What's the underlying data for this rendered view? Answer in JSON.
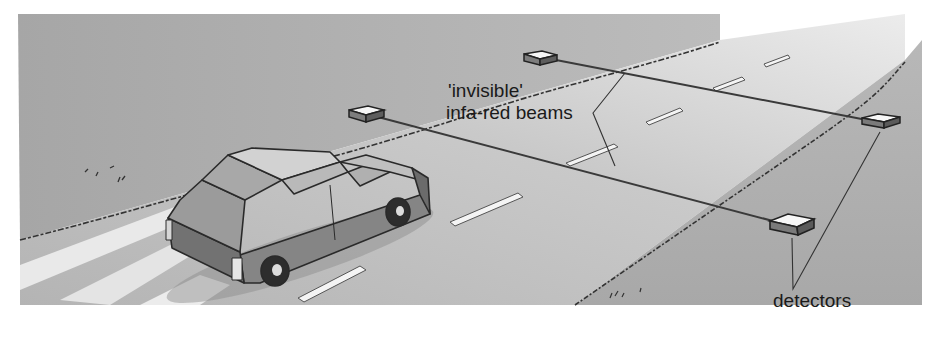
{
  "figure": {
    "labels": {
      "beams_line1": "'invisible'",
      "beams_line2": "infa-red beams",
      "detectors": "detectors"
    },
    "colors": {
      "background": "#ffffff",
      "grass": "#a9a9a9",
      "road": "#bdbdbd",
      "road_light": "#e2e2e2",
      "car_body": "#8c8c8c",
      "car_dark": "#5a5a5a",
      "line": "#2a2a2a",
      "lane_marking": "#f2f2f2"
    }
  }
}
